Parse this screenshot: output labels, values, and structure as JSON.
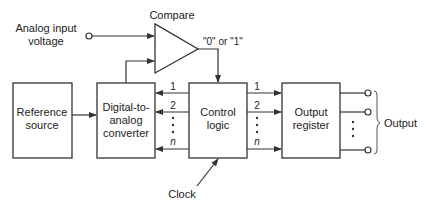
{
  "diagram": {
    "input": {
      "label_line1": "Analog input",
      "label_line2": "voltage"
    },
    "comparator": {
      "label": "Compare",
      "output_label": "\"0\" or \"1\""
    },
    "blocks": {
      "reference": {
        "line1": "Reference",
        "line2": "source"
      },
      "dac": {
        "line1": "Digital-to-",
        "line2": "analog",
        "line3": "converter"
      },
      "control": {
        "line1": "Control",
        "line2": "logic"
      },
      "register": {
        "line1": "Output",
        "line2": "register"
      }
    },
    "bus_labels": {
      "first": "1",
      "second": "2",
      "last": "n"
    },
    "clock_label": "Clock",
    "output_label": "Output"
  }
}
